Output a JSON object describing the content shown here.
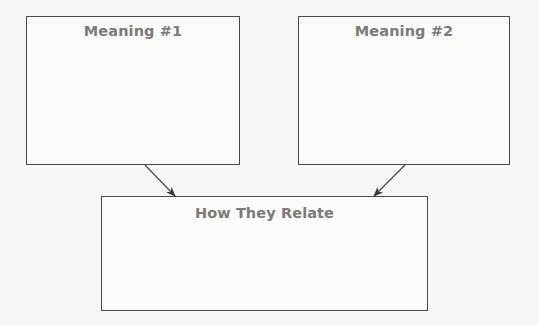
{
  "diagram": {
    "boxes": [
      {
        "id": "meaning-1",
        "title": "Meaning #1"
      },
      {
        "id": "meaning-2",
        "title": "Meaning #2"
      },
      {
        "id": "relation",
        "title": "How They Relate"
      }
    ],
    "arrows": [
      {
        "from": "meaning-1",
        "to": "relation"
      },
      {
        "from": "meaning-2",
        "to": "relation"
      }
    ],
    "colors": {
      "border": "#4a4a4a",
      "title_text": "#7a7a7a",
      "background": "#f7f7f5"
    }
  }
}
